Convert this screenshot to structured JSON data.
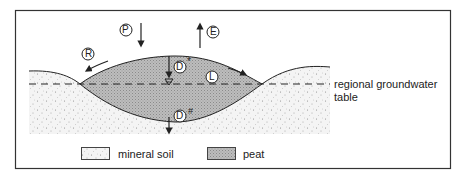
{
  "diagram": {
    "labels": {
      "P": "P",
      "E": "E",
      "R": "R",
      "L": "L",
      "D_top": "D",
      "D_top_mark": "*",
      "D_bottom": "D",
      "D_bottom_mark": "#",
      "water_table_line1": "regional groundwater",
      "water_table_line2": "table"
    },
    "legend": [
      {
        "label": "mineral soil",
        "pattern": "stipple"
      },
      {
        "label": "peat",
        "pattern": "hatched-gray"
      }
    ],
    "colors": {
      "peat_fill": "#b8b8b8",
      "soil_fill": "#f0f0f0",
      "outline": "#222222",
      "frame": "#333333"
    }
  }
}
